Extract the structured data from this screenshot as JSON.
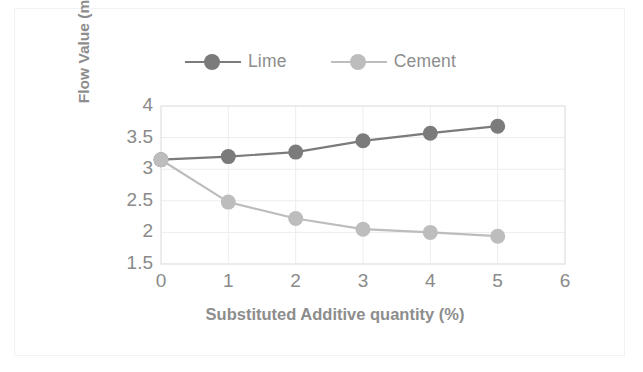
{
  "chart_data": {
    "type": "line",
    "title": "",
    "xlabel": "Substituted Additive quantity (%)",
    "ylabel": "Flow Value (mm)",
    "x": [
      0,
      1,
      2,
      3,
      4,
      5
    ],
    "xlim": [
      0,
      6
    ],
    "ylim": [
      1.5,
      4
    ],
    "xticks": [
      "0",
      "1",
      "2",
      "3",
      "4",
      "5",
      "6"
    ],
    "yticks": [
      "1.5",
      "2",
      "2.5",
      "3",
      "3.5",
      "4"
    ],
    "grid": true,
    "legend_position": "top-center",
    "series": [
      {
        "name": "Lime",
        "color": "#7b7b7b",
        "marker": "circle",
        "values": [
          3.15,
          3.2,
          3.27,
          3.45,
          3.57,
          3.68
        ]
      },
      {
        "name": "Cement",
        "color": "#bdbdbd",
        "marker": "circle",
        "values": [
          3.15,
          2.48,
          2.22,
          2.05,
          2.0,
          1.94
        ]
      }
    ]
  },
  "style": {
    "grid_color": "#ededed",
    "plot_border_color": "#e4e4e4",
    "tick_label_color": "#8a8a8a",
    "axis_title_color": "#8d8d8d",
    "frame_color": "#f2f2f2",
    "background": "#ffffff"
  }
}
